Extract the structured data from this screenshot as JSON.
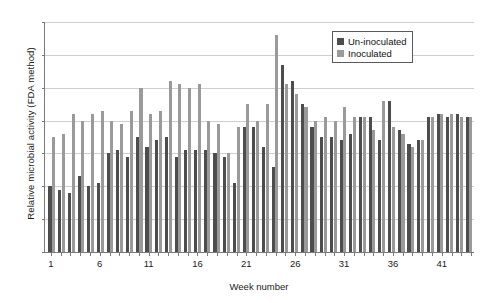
{
  "chart_data": {
    "type": "bar",
    "title": "",
    "xlabel": "Week number",
    "ylabel": "Relative microbial activity (FDA method)",
    "ylim": [
      0,
      0.7
    ],
    "ytick_values": [
      0.7,
      0.6,
      0.5,
      0.4,
      0.3,
      0.2,
      0.1,
      0
    ],
    "ytick_labels": [
      "0.7",
      "0.6",
      "0.5",
      "0.4",
      "0.3",
      "0.2",
      "0.1",
      "0"
    ],
    "grid": true,
    "legend_position": "top-right",
    "xtick_labels": [
      "1",
      "6",
      "11",
      "16",
      "21",
      "26",
      "31",
      "36",
      "41"
    ],
    "xtick_weeks": [
      1,
      6,
      11,
      16,
      21,
      26,
      31,
      36,
      41
    ],
    "categories": [
      1,
      2,
      3,
      4,
      5,
      6,
      7,
      8,
      9,
      10,
      11,
      12,
      13,
      14,
      15,
      16,
      17,
      18,
      19,
      20,
      21,
      22,
      23,
      24,
      25,
      26,
      27,
      28,
      29,
      30,
      31,
      32,
      33,
      34,
      35,
      36,
      37,
      38,
      39,
      40,
      41,
      42,
      43,
      44
    ],
    "series": [
      {
        "name": "Un-inoculated",
        "color": "#4d4d4d",
        "values": [
          0.2,
          0.19,
          0.18,
          0.23,
          0.2,
          0.21,
          0.3,
          0.31,
          0.29,
          0.35,
          0.32,
          0.34,
          0.35,
          0.29,
          0.31,
          0.31,
          0.31,
          0.3,
          0.29,
          0.21,
          0.38,
          0.38,
          0.32,
          0.26,
          0.57,
          0.52,
          0.45,
          0.38,
          0.35,
          0.35,
          0.34,
          0.36,
          0.41,
          0.41,
          0.34,
          0.46,
          0.37,
          0.33,
          0.34,
          0.41,
          0.42,
          0.41,
          0.42,
          0.41
        ]
      },
      {
        "name": "Inoculated",
        "color": "#9a9a9a",
        "values": [
          0.35,
          0.36,
          0.42,
          0.4,
          0.42,
          0.43,
          0.4,
          0.39,
          0.43,
          0.5,
          0.42,
          0.43,
          0.52,
          0.51,
          0.5,
          0.51,
          0.4,
          0.39,
          0.3,
          0.38,
          0.45,
          0.4,
          0.45,
          0.66,
          0.51,
          0.48,
          0.44,
          0.4,
          0.41,
          0.4,
          0.44,
          0.41,
          0.41,
          0.37,
          0.46,
          0.38,
          0.36,
          0.32,
          0.34,
          0.41,
          0.42,
          0.42,
          0.41,
          0.41
        ]
      }
    ]
  },
  "legend": {
    "items": [
      {
        "label": "Un-inoculated",
        "swatch_class": "uninoc"
      },
      {
        "label": "Inoculated",
        "swatch_class": "inoc"
      }
    ]
  },
  "colors": {
    "uninoculated": "#4d4d4d",
    "inoculated": "#9a9a9a",
    "gridline": "#cfcfcf",
    "axis": "#7a7a7a",
    "background": "#ffffff"
  }
}
